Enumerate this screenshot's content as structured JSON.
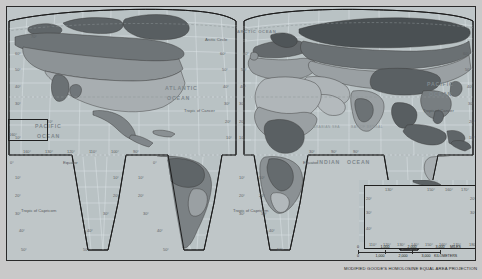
{
  "map": {
    "projection_note": "MODIFIED GOODE'S HOMOLOSINE EQUAL AREA PROJECTION",
    "oceans": [
      {
        "name": "ATLANTIC OCEAN",
        "line1": "ATLANTIC",
        "line2": "OCEAN"
      },
      {
        "name": "PACIFIC OCEAN",
        "line1": "PACIFIC",
        "line2": "OCEAN"
      },
      {
        "name": "PACIFIC OCEAN right",
        "line1": "PACIFIC",
        "line2": "OCEAN"
      },
      {
        "name": "INDIAN OCEAN",
        "line1": "INDIAN",
        "line2": "OCEAN"
      },
      {
        "name": "ARCTIC OCEAN",
        "line1": "ARCTIC OCEAN",
        "line2": ""
      }
    ],
    "seas": [
      "ARABIAN SEA",
      "BAY OF BENGAL",
      "CORAL SEA"
    ],
    "reference_lines": [
      "Arctic Circle",
      "Tropic of Cancer",
      "Equator",
      "Tropic of Capricorn"
    ],
    "labels": {
      "arctic_circle": "Arctic Circle",
      "arctic_ocean": "ARCTIC OCEAN",
      "tropic_cancer": "Tropic of Cancer",
      "equator": "Equator",
      "tropic_capricorn": "Tropic of Capricorn",
      "atlantic_1": "ATLANTIC",
      "atlantic_2": "OCEAN",
      "pacific_w_1": "PACIFIC",
      "pacific_w_2": "OCEAN",
      "pacific_e_1": "PACIFIC",
      "pacific_e_2": "OCEAN",
      "indian_1": "INDIAN",
      "indian_2": "OCEAN",
      "arabian_sea": "ARABIAN SEA",
      "bay_of_bengal": "BAY OF BENGAL",
      "coral_sea": "CORAL SEA"
    },
    "graticule_labels": {
      "west_lon_row": [
        "160°",
        "130°",
        "120°",
        "110°",
        "100°",
        "90°"
      ],
      "lat_left": [
        "80°",
        "70°",
        "60°",
        "50°",
        "40°",
        "30°",
        "20°",
        "10°",
        "0°"
      ],
      "lat_values": [
        "80°",
        "70°",
        "60°",
        "50°",
        "40°",
        "30°",
        "20°",
        "10°",
        "0°",
        "10°",
        "20°",
        "30°",
        "40°",
        "50°"
      ],
      "hawaii_box_lon": "160°"
    },
    "inset": {
      "name": "Australia and New Zealand",
      "lon_labels": [
        "110°",
        "120°",
        "130°",
        "140°",
        "150°",
        "160°",
        "170°",
        "180°"
      ],
      "lat_labels": [
        "20°",
        "30°",
        "40°"
      ],
      "sea_label": "CORAL SEA"
    },
    "scale": {
      "miles": {
        "ticks": [
          "0",
          "1,000",
          "2,000",
          "3,000"
        ],
        "unit": "MILES"
      },
      "kilometers": {
        "ticks": [
          "0",
          "1,000",
          "2,000",
          "3,000"
        ],
        "unit": "KILOMETERS"
      }
    }
  }
}
